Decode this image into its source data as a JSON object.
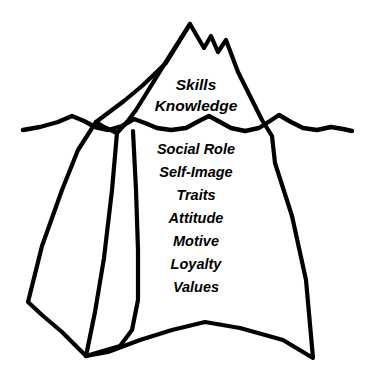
{
  "diagram": {
    "type": "iceberg-competency-model",
    "title": "",
    "background_color": "#ffffff",
    "line_color": "#000000",
    "fill_color": "#ffffff",
    "waterline": {
      "name": "water-line",
      "y_position": 128
    },
    "above_water": {
      "section_name": "visible-competencies",
      "labels": [
        {
          "text": "Skills",
          "x": 196,
          "y": 90
        },
        {
          "text": "Knowledge",
          "x": 196,
          "y": 111
        }
      ]
    },
    "below_water": {
      "section_name": "hidden-competencies",
      "labels": [
        {
          "text": "Social Role",
          "x": 196,
          "y": 154
        },
        {
          "text": "Self-Image",
          "x": 196,
          "y": 177
        },
        {
          "text": "Traits",
          "x": 196,
          "y": 200
        },
        {
          "text": "Attitude",
          "x": 196,
          "y": 223
        },
        {
          "text": "Motive",
          "x": 196,
          "y": 246
        },
        {
          "text": "Loyalty",
          "x": 196,
          "y": 269
        },
        {
          "text": "Values",
          "x": 196,
          "y": 292
        }
      ]
    },
    "shapes": {
      "iceberg_outline": "M 190 24 L 176 46 L 162 68 L 146 94 L 136 110 L 127 122 L 117 133 L 104 127 L 96 122 L 108 113 L 124 101 L 142 86 L 166 63 L 190 24 Z",
      "main_body": "M 190 24 L 204 48 L 211 36 L 218 52 L 226 40 L 232 56 L 238 72 L 250 96 L 262 120 L 272 136 L 275 163 L 292 216 L 306 280 L 313 358 L 283 340 L 240 328 L 205 322 L 172 330 L 140 340 L 108 352 L 86 356 L 62 332 L 42 315 L 28 302 L 42 246 L 62 190 L 78 150 L 96 122 L 108 113 L 124 101 L 142 86 L 166 63 Z",
      "ridge_left": "M 117 133 L 112 190 L 104 258 L 95 312 L 86 356",
      "ridge_right": "M 133 131 L 136 190 L 138 250 L 138 300 L 132 330 L 120 346 L 86 356",
      "wave": "M 23 130 L 40 127 L 58 122 L 72 116 L 84 121 L 95 127 L 108 130 L 122 126 L 134 119 L 145 123 L 157 128 L 171 130 L 186 128 L 199 121 L 209 116 L 220 122 L 231 128 L 245 131 L 259 128 L 270 121 L 279 115 L 291 122 L 303 128 L 317 130 L 331 127 L 343 129 L 352 131"
    }
  }
}
